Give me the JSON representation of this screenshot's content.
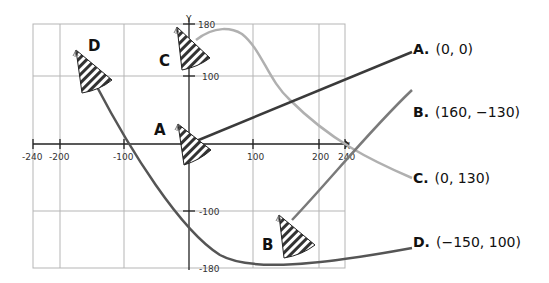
{
  "diagram": {
    "type": "coordinate-plane-matching",
    "axes": {
      "x_label": "X",
      "y_label": "Y",
      "x_ticks": [
        "-240",
        "-200",
        "-100",
        "100",
        "200",
        "240"
      ],
      "y_ticks": [
        "180",
        "100",
        "-100",
        "-180"
      ],
      "x_range": [
        -240,
        240
      ],
      "y_range": [
        -180,
        180
      ]
    },
    "points": [
      {
        "label": "A",
        "x": 0,
        "y": 0
      },
      {
        "label": "B",
        "x": 160,
        "y": -130
      },
      {
        "label": "C",
        "x": 0,
        "y": 130
      },
      {
        "label": "D",
        "x": -150,
        "y": 100
      }
    ],
    "answers": [
      {
        "letter": "A.",
        "coords": "(0, 0)",
        "line_color": "#3a3a3a"
      },
      {
        "letter": "B.",
        "coords": "(160, −130)",
        "line_color": "#7a7a7a"
      },
      {
        "letter": "C.",
        "coords": "(0, 130)",
        "line_color": "#b0b0b0"
      },
      {
        "letter": "D.",
        "coords": "(−150, 100)",
        "line_color": "#555555"
      }
    ],
    "icon": "party-hat-icon"
  }
}
